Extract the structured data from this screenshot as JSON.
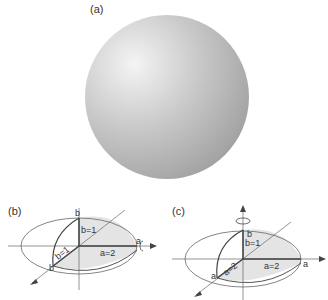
{
  "panels": {
    "a": {
      "label": "(a)"
    },
    "b": {
      "label": "(b)",
      "labels": {
        "b_top": "b",
        "b_eq": "b=1",
        "b_diag": "b=1",
        "b_corner": "b",
        "a_eq": "a=2",
        "a_end": "a"
      }
    },
    "c": {
      "label": "(c)",
      "labels": {
        "b_top": "b",
        "b_eq": "b=1",
        "a_diag": "a=2",
        "a_corner": "a",
        "a_eq": "a=2",
        "a_end": "a"
      }
    }
  },
  "colors": {
    "sphere_light": "#f2f2f2",
    "sphere_dark": "#9e9e9e",
    "fill": "#e4e4e4",
    "line": "#555555"
  }
}
